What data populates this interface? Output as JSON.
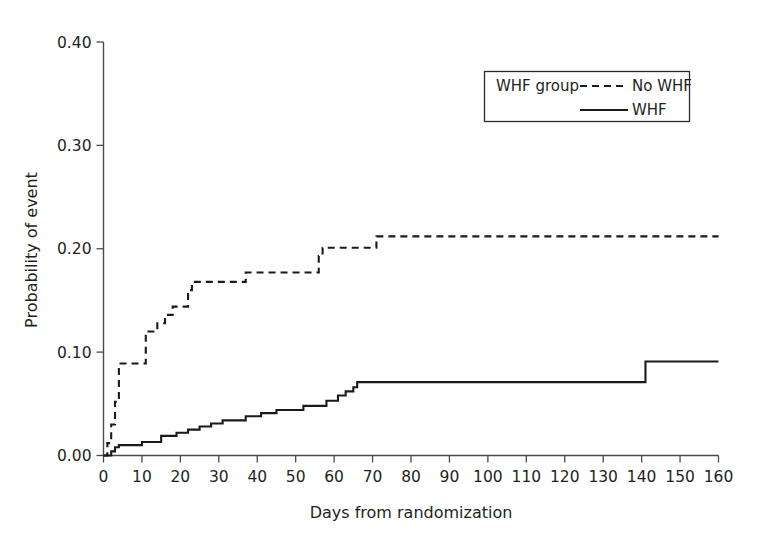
{
  "chart_data": {
    "type": "line",
    "subtype": "kaplan-meier-step",
    "title": "",
    "xlabel": "Days from randomization",
    "ylabel": "Probability of event",
    "xlim": [
      0,
      160
    ],
    "ylim": [
      0.0,
      0.4
    ],
    "xticks": [
      0,
      10,
      20,
      30,
      40,
      50,
      60,
      70,
      80,
      90,
      100,
      110,
      120,
      130,
      140,
      150,
      160
    ],
    "xticklabels": [
      "0",
      "10",
      "20",
      "30",
      "40",
      "50",
      "60",
      "70",
      "80",
      "90",
      "100",
      "110",
      "120",
      "130",
      "140",
      "150",
      "160"
    ],
    "yticks": [
      0.0,
      0.1,
      0.2,
      0.3,
      0.4
    ],
    "yticklabels": [
      "0.00",
      "0.10",
      "0.20",
      "0.30",
      "0.40"
    ],
    "grid": false,
    "legend": {
      "title": "WHF group",
      "position": "top-right",
      "entries": [
        {
          "label": "No WHF",
          "style": "dashed"
        },
        {
          "label": "WHF",
          "style": "solid"
        }
      ]
    },
    "series": [
      {
        "name": "No WHF",
        "style": "dashed",
        "color": "#1a1a1a",
        "x": [
          0,
          1,
          2,
          3,
          4,
          10,
          11,
          14,
          16,
          18,
          20,
          22,
          23,
          36,
          37,
          55,
          56,
          57,
          70,
          71,
          160
        ],
        "y": [
          0.0,
          0.012,
          0.03,
          0.052,
          0.089,
          0.089,
          0.12,
          0.128,
          0.136,
          0.144,
          0.144,
          0.16,
          0.168,
          0.168,
          0.177,
          0.177,
          0.193,
          0.201,
          0.201,
          0.212,
          0.212
        ]
      },
      {
        "name": "WHF",
        "style": "solid",
        "color": "#1a1a1a",
        "x": [
          0,
          2,
          3,
          4,
          8,
          10,
          14,
          15,
          19,
          22,
          25,
          28,
          31,
          34,
          37,
          41,
          45,
          48,
          52,
          55,
          58,
          61,
          63,
          65,
          66,
          140,
          141,
          160
        ],
        "y": [
          0.0,
          0.004,
          0.008,
          0.01,
          0.01,
          0.013,
          0.013,
          0.019,
          0.022,
          0.025,
          0.028,
          0.031,
          0.034,
          0.034,
          0.038,
          0.041,
          0.044,
          0.044,
          0.048,
          0.048,
          0.053,
          0.058,
          0.062,
          0.066,
          0.071,
          0.071,
          0.091,
          0.091
        ]
      }
    ]
  },
  "axes": {
    "y_axis_title": "Probability of event",
    "x_axis_title": "Days from randomization"
  },
  "legend": {
    "group_title": "WHF group",
    "item_no_whf": "No WHF",
    "item_whf": "WHF"
  },
  "colors": {
    "line": "#1a1a1a",
    "axis": "#4a4a4a",
    "text": "#231f20",
    "background": "#ffffff"
  }
}
